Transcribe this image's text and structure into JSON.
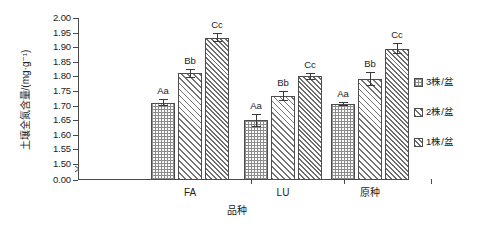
{
  "chart_data": {
    "type": "bar",
    "title": "",
    "xlabel": "品种",
    "ylabel": "土壤全氮含量/(mg·g⁻¹)",
    "categories": [
      "FA",
      "LU",
      "原种"
    ],
    "ylim": [
      1.5,
      2.0
    ],
    "y_break_value": "0.00",
    "yticks": [
      "0.00",
      "1.50",
      "1.55",
      "1.60",
      "1.65",
      "1.70",
      "1.75",
      "1.80",
      "1.85",
      "1.90",
      "1.95",
      "2.00"
    ],
    "grid": false,
    "legend_position": "right",
    "series": [
      {
        "name": "3株/盆",
        "pattern": "grid",
        "values": [
          1.71,
          1.65,
          1.705
        ],
        "errors": [
          0.012,
          0.022,
          0.006
        ],
        "labels": [
          "Aa",
          "Aa",
          "Aa"
        ]
      },
      {
        "name": "2株/盆",
        "pattern": "diagonal-forward",
        "values": [
          1.81,
          1.733,
          1.79
        ],
        "errors": [
          0.014,
          0.018,
          0.024
        ],
        "labels": [
          "Bb",
          "Bb",
          "Bb"
        ]
      },
      {
        "name": "1株/盆",
        "pattern": "diagonal-back",
        "values": [
          1.933,
          1.8,
          1.895
        ],
        "errors": [
          0.016,
          0.012,
          0.02
        ],
        "labels": [
          "Cc",
          "Cc",
          "Cc"
        ]
      }
    ]
  },
  "legend": {
    "items": [
      {
        "label": "3株/盆",
        "icon": "grid-swatch-icon"
      },
      {
        "label": "2株/盆",
        "icon": "diagonal-forward-swatch-icon"
      },
      {
        "label": "1株/盆",
        "icon": "diagonal-back-swatch-icon"
      }
    ]
  },
  "axes": {
    "x_title": "品种",
    "y_title": "土壤全氮含量/(mg·g⁻¹)"
  },
  "colors": {
    "axis": "#4a4a4a",
    "bar_outline": "#4d4d4d",
    "hatch": "#7d7d7d",
    "text": "#222222",
    "background": "#ffffff"
  }
}
